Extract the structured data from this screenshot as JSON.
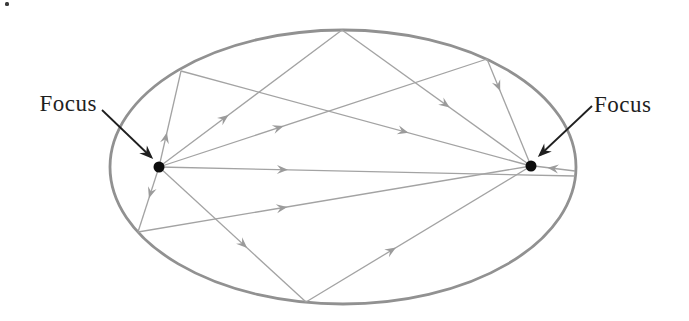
{
  "figure": {
    "type": "ellipse-reflection-diagram",
    "width": 689,
    "height": 321,
    "background": "#ffffff",
    "colors": {
      "ellipse_stroke": "#919191",
      "ray_stroke": "#a3a3a3",
      "ray_arrow_fill": "#9b9b9b",
      "focus_dot": "#0d0d0d",
      "label_text": "#1f1f1f",
      "label_arrow": "#1f1f1f"
    },
    "ellipse": {
      "cx": 343,
      "cy": 167,
      "rx": 233,
      "ry": 137,
      "stroke_width": 2.8
    },
    "foci": [
      {
        "id": "F1",
        "x": 159,
        "y": 167,
        "r": 5.5
      },
      {
        "id": "F2",
        "x": 531,
        "y": 166,
        "r": 5.5
      }
    ],
    "labels": {
      "left": {
        "text": "Focus",
        "x": 97,
        "y": 111,
        "anchor": "end",
        "font_size": 23
      },
      "right": {
        "text": "Focus",
        "x": 594,
        "y": 112,
        "anchor": "start",
        "font_size": 23
      }
    },
    "label_arrows": [
      {
        "name": "left-focus-pointer",
        "x1": 102,
        "y1": 110,
        "x2": 151,
        "y2": 157
      },
      {
        "name": "right-focus-pointer",
        "x1": 592,
        "y1": 106,
        "x2": 540,
        "y2": 155
      }
    ],
    "rays": [
      {
        "name": "F1-to-upper-left-wall",
        "x1": 159,
        "y1": 167,
        "x2": 181,
        "y2": 71,
        "arrow_t": 0.36
      },
      {
        "name": "F1-to-lower-left-wall",
        "x1": 159,
        "y1": 167,
        "x2": 138,
        "y2": 232,
        "arrow_t": 0.48
      },
      {
        "name": "F1-to-top-wall",
        "x1": 159,
        "y1": 167,
        "x2": 342,
        "y2": 30,
        "arrow_t": 0.38
      },
      {
        "name": "F1-to-upper-right-wall",
        "x1": 159,
        "y1": 167,
        "x2": 487,
        "y2": 59,
        "arrow_t": 0.38
      },
      {
        "name": "F1-to-right-vertex",
        "x1": 159,
        "y1": 167,
        "x2": 575,
        "y2": 176,
        "arrow_t": 0.31
      },
      {
        "name": "F1-to-bottom-wall",
        "x1": 159,
        "y1": 167,
        "x2": 306,
        "y2": 302,
        "arrow_t": 0.6
      },
      {
        "name": "upper-left-wall-to-F2",
        "x1": 181,
        "y1": 71,
        "x2": 531,
        "y2": 166,
        "arrow_t": 0.65
      },
      {
        "name": "lower-left-wall-to-F2",
        "x1": 138,
        "y1": 232,
        "x2": 531,
        "y2": 166,
        "arrow_t": 0.38
      },
      {
        "name": "top-wall-to-F2",
        "x1": 342,
        "y1": 30,
        "x2": 531,
        "y2": 166,
        "arrow_t": 0.57
      },
      {
        "name": "upper-right-wall-to-F2",
        "x1": 487,
        "y1": 59,
        "x2": 531,
        "y2": 166,
        "arrow_t": 0.3
      },
      {
        "name": "right-vertex-to-F2",
        "x1": 575,
        "y1": 171,
        "x2": 534,
        "y2": 166,
        "arrow_t": 0.67
      },
      {
        "name": "bottom-wall-to-F2",
        "x1": 306,
        "y1": 302,
        "x2": 531,
        "y2": 166,
        "arrow_t": 0.4
      }
    ],
    "artifact": {
      "x": 5,
      "y": 2,
      "w": 4,
      "h": 4
    }
  }
}
